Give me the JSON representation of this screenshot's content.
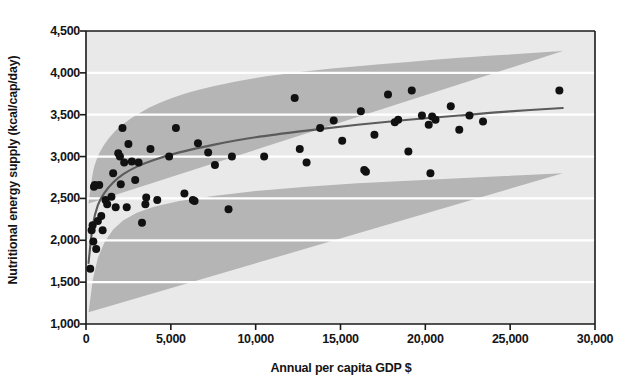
{
  "chart_data": {
    "type": "scatter",
    "title": "",
    "xlabel": "Annual per capita GDP $",
    "ylabel": "Nutritional energy supply (kcal/cap/day)",
    "xlim": [
      0,
      30000
    ],
    "ylim": [
      1000,
      4500
    ],
    "xticks": [
      0,
      5000,
      10000,
      15000,
      20000,
      25000,
      30000
    ],
    "xtick_labels": [
      "0",
      "5,000",
      "10,000",
      "15,000",
      "20,000",
      "25,000",
      "30,000"
    ],
    "yticks": [
      1000,
      1500,
      2000,
      2500,
      3000,
      3500,
      4000,
      4500
    ],
    "ytick_labels": [
      "1,000",
      "1,500",
      "2,000",
      "2,500",
      "3,000",
      "3,500",
      "4,000",
      "4,500"
    ],
    "grid": "horizontal-white-lines",
    "legend": "none",
    "plot_background": "#e8e8e8",
    "band_color": "#b4b4b4",
    "point_color": "#111111",
    "fit_line_color": "#5a5a5a",
    "points": [
      {
        "x": 250,
        "y": 1660
      },
      {
        "x": 330,
        "y": 2120
      },
      {
        "x": 390,
        "y": 2180
      },
      {
        "x": 430,
        "y": 1985
      },
      {
        "x": 470,
        "y": 2640
      },
      {
        "x": 520,
        "y": 2660
      },
      {
        "x": 600,
        "y": 1895
      },
      {
        "x": 700,
        "y": 2230
      },
      {
        "x": 780,
        "y": 2660
      },
      {
        "x": 900,
        "y": 2290
      },
      {
        "x": 980,
        "y": 2120
      },
      {
        "x": 1150,
        "y": 2480
      },
      {
        "x": 1250,
        "y": 2430
      },
      {
        "x": 1500,
        "y": 2520
      },
      {
        "x": 1600,
        "y": 2800
      },
      {
        "x": 1750,
        "y": 2395
      },
      {
        "x": 1900,
        "y": 3040
      },
      {
        "x": 2000,
        "y": 3000
      },
      {
        "x": 2050,
        "y": 2670
      },
      {
        "x": 2150,
        "y": 3340
      },
      {
        "x": 2250,
        "y": 2930
      },
      {
        "x": 2400,
        "y": 2395
      },
      {
        "x": 2500,
        "y": 3150
      },
      {
        "x": 2700,
        "y": 2940
      },
      {
        "x": 2900,
        "y": 2720
      },
      {
        "x": 3100,
        "y": 2930
      },
      {
        "x": 3300,
        "y": 2210
      },
      {
        "x": 3500,
        "y": 2430
      },
      {
        "x": 3550,
        "y": 2510
      },
      {
        "x": 3800,
        "y": 3090
      },
      {
        "x": 4200,
        "y": 2480
      },
      {
        "x": 4900,
        "y": 3000
      },
      {
        "x": 5300,
        "y": 3340
      },
      {
        "x": 5800,
        "y": 2560
      },
      {
        "x": 6300,
        "y": 2480
      },
      {
        "x": 6400,
        "y": 2470
      },
      {
        "x": 6600,
        "y": 3160
      },
      {
        "x": 7200,
        "y": 3050
      },
      {
        "x": 7600,
        "y": 2900
      },
      {
        "x": 8400,
        "y": 2370
      },
      {
        "x": 8600,
        "y": 3000
      },
      {
        "x": 10500,
        "y": 3000
      },
      {
        "x": 12300,
        "y": 3700
      },
      {
        "x": 12600,
        "y": 3090
      },
      {
        "x": 13000,
        "y": 2930
      },
      {
        "x": 13800,
        "y": 3340
      },
      {
        "x": 14600,
        "y": 3430
      },
      {
        "x": 15100,
        "y": 3190
      },
      {
        "x": 16200,
        "y": 3540
      },
      {
        "x": 16400,
        "y": 2840
      },
      {
        "x": 16500,
        "y": 2820
      },
      {
        "x": 17000,
        "y": 3260
      },
      {
        "x": 17800,
        "y": 3740
      },
      {
        "x": 18200,
        "y": 3410
      },
      {
        "x": 18400,
        "y": 3440
      },
      {
        "x": 19000,
        "y": 3060
      },
      {
        "x": 19200,
        "y": 3790
      },
      {
        "x": 19800,
        "y": 3490
      },
      {
        "x": 20200,
        "y": 3380
      },
      {
        "x": 20300,
        "y": 2800
      },
      {
        "x": 20400,
        "y": 3480
      },
      {
        "x": 20600,
        "y": 3440
      },
      {
        "x": 21500,
        "y": 3600
      },
      {
        "x": 22000,
        "y": 3320
      },
      {
        "x": 22600,
        "y": 3490
      },
      {
        "x": 23400,
        "y": 3420
      },
      {
        "x": 27900,
        "y": 3790
      }
    ],
    "fit_line": [
      {
        "x": 150,
        "y": 1730
      },
      {
        "x": 400,
        "y": 2180
      },
      {
        "x": 700,
        "y": 2420
      },
      {
        "x": 1100,
        "y": 2570
      },
      {
        "x": 1600,
        "y": 2690
      },
      {
        "x": 2200,
        "y": 2790
      },
      {
        "x": 3000,
        "y": 2880
      },
      {
        "x": 4000,
        "y": 2960
      },
      {
        "x": 5500,
        "y": 3050
      },
      {
        "x": 7500,
        "y": 3140
      },
      {
        "x": 10000,
        "y": 3230
      },
      {
        "x": 13000,
        "y": 3310
      },
      {
        "x": 16000,
        "y": 3380
      },
      {
        "x": 19000,
        "y": 3440
      },
      {
        "x": 22000,
        "y": 3490
      },
      {
        "x": 25000,
        "y": 3540
      },
      {
        "x": 28100,
        "y": 3580
      }
    ],
    "band_upper": [
      {
        "x": 150,
        "y": 2440
      },
      {
        "x": 400,
        "y": 2800
      },
      {
        "x": 700,
        "y": 3000
      },
      {
        "x": 1100,
        "y": 3150
      },
      {
        "x": 1600,
        "y": 3280
      },
      {
        "x": 2200,
        "y": 3390
      },
      {
        "x": 3000,
        "y": 3500
      },
      {
        "x": 4000,
        "y": 3610
      },
      {
        "x": 5500,
        "y": 3730
      },
      {
        "x": 7500,
        "y": 3840
      },
      {
        "x": 10000,
        "y": 3940
      },
      {
        "x": 13000,
        "y": 4020
      },
      {
        "x": 16000,
        "y": 4080
      },
      {
        "x": 19000,
        "y": 4130
      },
      {
        "x": 22000,
        "y": 4180
      },
      {
        "x": 25000,
        "y": 4220
      },
      {
        "x": 28100,
        "y": 4260
      }
    ],
    "band_lower": [
      {
        "x": 150,
        "y": 1140
      },
      {
        "x": 400,
        "y": 1530
      },
      {
        "x": 700,
        "y": 1790
      },
      {
        "x": 1100,
        "y": 1980
      },
      {
        "x": 1600,
        "y": 2130
      },
      {
        "x": 2200,
        "y": 2240
      },
      {
        "x": 3000,
        "y": 2330
      },
      {
        "x": 4000,
        "y": 2400
      },
      {
        "x": 5500,
        "y": 2470
      },
      {
        "x": 7500,
        "y": 2530
      },
      {
        "x": 10000,
        "y": 2590
      },
      {
        "x": 13000,
        "y": 2640
      },
      {
        "x": 16000,
        "y": 2680
      },
      {
        "x": 19000,
        "y": 2710
      },
      {
        "x": 22000,
        "y": 2740
      },
      {
        "x": 25000,
        "y": 2770
      },
      {
        "x": 28100,
        "y": 2800
      }
    ]
  }
}
